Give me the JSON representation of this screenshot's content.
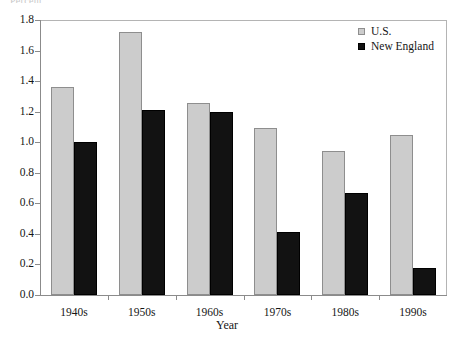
{
  "chart_data": {
    "type": "bar",
    "title": "",
    "xlabel": "Year",
    "ylabel": "Percent",
    "categories": [
      "1940s",
      "1950s",
      "1960s",
      "1970s",
      "1980s",
      "1990s"
    ],
    "series": [
      {
        "name": "U.S.",
        "color": "#cccccc",
        "values": [
          1.36,
          1.72,
          1.26,
          1.09,
          0.94,
          1.05
        ]
      },
      {
        "name": "New England",
        "color": "#111111",
        "values": [
          1.0,
          1.21,
          1.2,
          0.41,
          0.67,
          0.18
        ]
      }
    ],
    "ylim": [
      0.0,
      1.8
    ],
    "ytick_labels": [
      "0.0",
      "0.2",
      "0.4",
      "0.6",
      "0.8",
      "1.0",
      "1.2",
      "1.4",
      "1.6",
      "1.8"
    ],
    "ytick_values": [
      0.0,
      0.2,
      0.4,
      0.6,
      0.8,
      1.0,
      1.2,
      1.4,
      1.6,
      1.8
    ],
    "grid": false,
    "legend_position": "top-right"
  },
  "axes": {
    "y_title_clipped": "Percent",
    "x_title": "Year"
  },
  "legend": {
    "entries": [
      {
        "label": "U.S.",
        "swatch": "light-gray-square"
      },
      {
        "label": "New England",
        "swatch": "black-square"
      }
    ]
  }
}
